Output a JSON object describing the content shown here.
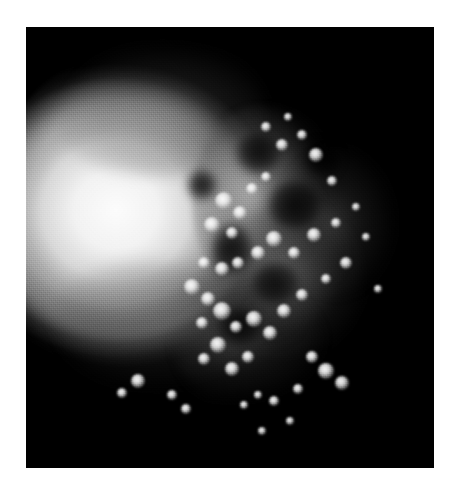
{
  "page": {
    "width": 451,
    "height": 496,
    "background_color": "#ffffff",
    "caption": ""
  },
  "figure": {
    "panel_label": "",
    "modality": "grayscale speckle scan",
    "panel": {
      "x": 26,
      "y": 27,
      "width": 408,
      "height": 441,
      "background_color": "#000000",
      "border": "none"
    },
    "colors": {
      "background": "#000000",
      "page": "#ffffff",
      "highlight": "#ffffff",
      "midtone": "#969696",
      "shadow": "#202020"
    },
    "regions": [
      {
        "name": "bright-lobe",
        "description": "smooth high-intensity crescent lobe occupying the left half",
        "cx": 108,
        "cy": 190,
        "rx": 150,
        "ry": 168,
        "peak_intensity": 252
      },
      {
        "name": "speckle-field",
        "description": "granular nodular transition zone right of the lobe",
        "cx": 242,
        "cy": 173,
        "rx": 76,
        "ry": 95,
        "peak_intensity": 238
      },
      {
        "name": "dark-field",
        "description": "near-black background filling the upper-right and lower-right",
        "cx": 330,
        "cy": 90,
        "rx": 100,
        "ry": 80,
        "peak_intensity": 6
      }
    ],
    "voids": [
      {
        "x": 232,
        "y": 126,
        "w": 44,
        "h": 40
      },
      {
        "x": 268,
        "y": 178,
        "w": 52,
        "h": 46
      },
      {
        "x": 206,
        "y": 222,
        "w": 38,
        "h": 52
      },
      {
        "x": 250,
        "y": 256,
        "w": 46,
        "h": 40
      },
      {
        "x": 176,
        "y": 158,
        "w": 30,
        "h": 30
      },
      {
        "x": 296,
        "y": 132,
        "w": 36,
        "h": 34
      },
      {
        "x": 214,
        "y": 300,
        "w": 42,
        "h": 36
      }
    ],
    "nodules": [
      {
        "x": 198,
        "y": 174,
        "r": 9
      },
      {
        "x": 214,
        "y": 186,
        "r": 7
      },
      {
        "x": 186,
        "y": 198,
        "r": 8
      },
      {
        "x": 206,
        "y": 206,
        "r": 6
      },
      {
        "x": 226,
        "y": 162,
        "r": 6
      },
      {
        "x": 240,
        "y": 150,
        "r": 5
      },
      {
        "x": 256,
        "y": 118,
        "r": 6
      },
      {
        "x": 276,
        "y": 108,
        "r": 5
      },
      {
        "x": 290,
        "y": 128,
        "r": 7
      },
      {
        "x": 306,
        "y": 154,
        "r": 5
      },
      {
        "x": 178,
        "y": 236,
        "r": 6
      },
      {
        "x": 196,
        "y": 242,
        "r": 7
      },
      {
        "x": 212,
        "y": 236,
        "r": 6
      },
      {
        "x": 232,
        "y": 226,
        "r": 7
      },
      {
        "x": 248,
        "y": 212,
        "r": 8
      },
      {
        "x": 268,
        "y": 226,
        "r": 6
      },
      {
        "x": 288,
        "y": 208,
        "r": 7
      },
      {
        "x": 166,
        "y": 260,
        "r": 8
      },
      {
        "x": 182,
        "y": 272,
        "r": 7
      },
      {
        "x": 196,
        "y": 284,
        "r": 9
      },
      {
        "x": 176,
        "y": 296,
        "r": 6
      },
      {
        "x": 210,
        "y": 300,
        "r": 6
      },
      {
        "x": 228,
        "y": 292,
        "r": 8
      },
      {
        "x": 244,
        "y": 306,
        "r": 7
      },
      {
        "x": 192,
        "y": 318,
        "r": 8
      },
      {
        "x": 178,
        "y": 332,
        "r": 6
      },
      {
        "x": 206,
        "y": 342,
        "r": 7
      },
      {
        "x": 222,
        "y": 330,
        "r": 6
      },
      {
        "x": 258,
        "y": 284,
        "r": 7
      },
      {
        "x": 276,
        "y": 268,
        "r": 6
      },
      {
        "x": 300,
        "y": 252,
        "r": 5
      },
      {
        "x": 320,
        "y": 236,
        "r": 6
      },
      {
        "x": 310,
        "y": 196,
        "r": 5
      },
      {
        "x": 330,
        "y": 180,
        "r": 4
      },
      {
        "x": 286,
        "y": 330,
        "r": 6
      },
      {
        "x": 300,
        "y": 344,
        "r": 8
      },
      {
        "x": 316,
        "y": 356,
        "r": 7
      },
      {
        "x": 272,
        "y": 362,
        "r": 5
      },
      {
        "x": 248,
        "y": 374,
        "r": 5
      },
      {
        "x": 232,
        "y": 368,
        "r": 4
      },
      {
        "x": 218,
        "y": 378,
        "r": 4
      },
      {
        "x": 112,
        "y": 354,
        "r": 7
      },
      {
        "x": 96,
        "y": 366,
        "r": 5
      },
      {
        "x": 146,
        "y": 368,
        "r": 5
      },
      {
        "x": 160,
        "y": 382,
        "r": 5
      },
      {
        "x": 236,
        "y": 404,
        "r": 4
      },
      {
        "x": 264,
        "y": 394,
        "r": 4
      },
      {
        "x": 340,
        "y": 210,
        "r": 4
      },
      {
        "x": 352,
        "y": 262,
        "r": 4
      },
      {
        "x": 262,
        "y": 90,
        "r": 4
      },
      {
        "x": 240,
        "y": 100,
        "r": 5
      }
    ]
  }
}
